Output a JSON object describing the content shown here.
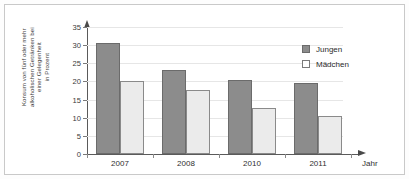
{
  "chart_data": {
    "type": "bar",
    "title": "",
    "subtitle": "",
    "xlabel": "Jahr",
    "ylabel": "Konsum von fünf oder mehr alkoholischen Getränken bei einer Gelegenheit in Prozent",
    "ylabel_lines": [
      "Konsum von fünf oder mehr",
      "alkoholischen Getränken bei",
      "einer Gelegenheit",
      "in Prozent"
    ],
    "categories": [
      "2007",
      "2008",
      "2010",
      "2011"
    ],
    "series": [
      {
        "name": "Jungen",
        "values": [
          30.7,
          23.1,
          20.3,
          19.5
        ],
        "color": "#8c8c8c"
      },
      {
        "name": "Mädchen",
        "values": [
          20.0,
          17.6,
          12.7,
          10.4
        ],
        "color": "#ebebeb"
      }
    ],
    "ylim": [
      0,
      35
    ],
    "ytick_step": 5,
    "yticks": [
      "0",
      "5",
      "10",
      "15",
      "20",
      "25",
      "30",
      "35"
    ],
    "grid": true,
    "legend_position": "top-right",
    "legend": [
      {
        "label": "Jungen",
        "swatch": "filled-gray-square"
      },
      {
        "label": "Mädchen",
        "swatch": "empty-white-square"
      }
    ]
  },
  "axes": {
    "y_arrow_icon": "arrow-up-icon",
    "x_arrow_icon": "arrow-right-icon"
  }
}
